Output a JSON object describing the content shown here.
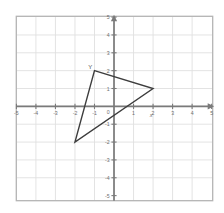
{
  "chart_data": {
    "type": "scatter",
    "title": "",
    "subtitle": "",
    "xlabel": "x",
    "ylabel": "",
    "xlim": [
      -5,
      5
    ],
    "ylim": [
      -5,
      5
    ],
    "grid": true,
    "legend": null,
    "x_ticks": [
      "-5",
      "-4",
      "-3",
      "-2",
      "-1",
      "0",
      "1",
      "2",
      "3",
      "4",
      "5"
    ],
    "x_tick_values": [
      -5,
      -4,
      -3,
      -2,
      -1,
      0,
      1,
      2,
      3,
      4,
      5
    ],
    "y_ticks": [
      "5",
      "4",
      "3",
      "2",
      "1",
      "0",
      "-1",
      "-2",
      "-3",
      "-4",
      "-5"
    ],
    "y_tick_values": [
      5,
      4,
      3,
      2,
      1,
      0,
      -1,
      -2,
      -3,
      -4,
      -5
    ],
    "origin_label": "0",
    "shapes": [
      {
        "name": "triangle",
        "kind": "polygon",
        "closed": true,
        "fill": "none",
        "stroke": "#3d3d3d",
        "points": [
          {
            "x": -1,
            "y": 2
          },
          {
            "x": 2,
            "y": 1
          },
          {
            "x": -2,
            "y": -2
          }
        ],
        "vertex_labels": [
          {
            "text": "Y",
            "x": -1,
            "y": 2
          }
        ]
      }
    ],
    "annotations": [
      {
        "text": "x",
        "x": 1.9,
        "y": -0.6,
        "role": "axis-name"
      }
    ],
    "colors": {
      "background": "#ffffff",
      "grid": "#e0e0e0",
      "border": "#b4b4b4",
      "axis": "#7a7a7a",
      "tick_text": "#6e6e6e",
      "shape_stroke": "#3d3d3d"
    }
  }
}
